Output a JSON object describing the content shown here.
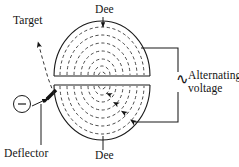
{
  "figure": {
    "type": "physics-diagram",
    "background_color": "#ffffff",
    "line_color": "#1a1a1a",
    "dash_color": "#2b2b2b"
  },
  "labels": {
    "dee_top": "Dee",
    "dee_bottom": "Dee",
    "target": "Target",
    "deflector": "Deflector",
    "alternating_voltage": "Alternating voltage",
    "ac_symbol": "∿",
    "ion_source_charge": "−"
  },
  "geometry": {
    "chamber_center_x": 102,
    "chamber_center_y": 81,
    "chamber_radius_x": 48,
    "chamber_radius_y": 55,
    "gap_top_y": 76,
    "gap_bottom_y": 85,
    "upper_arc_count": 6,
    "lower_arc_count": 6,
    "spiral_arrow_count": 4,
    "circuit_right_x": 178,
    "circuit_top_y": 48,
    "circuit_bottom_y": 122
  },
  "parts": {
    "upper_dee": "upper-dee",
    "lower_dee": "lower-dee",
    "ion_source": "ion-source",
    "deflector_plate": "deflector-plate",
    "target_path": "target-beam-path",
    "circuit": "ac-circuit-wiring"
  }
}
